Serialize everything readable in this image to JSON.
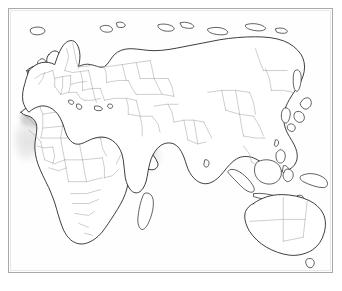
{
  "figure": {
    "hemisphere": "Eastern Hemisphere",
    "projection": "cylindrical",
    "background_color": "#ffffff",
    "frame_color": "#a9a9a9",
    "land_fill": "#ffffff",
    "coastline_color": "#1a1a1a",
    "country_border_color": "#9b9b9b"
  },
  "legend": {
    "visible": false,
    "classes": [
      {
        "name": "core-range",
        "label": "Core range",
        "color": "#9a9a9a",
        "opacity": 0.95
      },
      {
        "name": "main-range",
        "label": "Main range",
        "color": "#b4b4b4",
        "opacity": 0.9
      },
      {
        "name": "peripheral-range",
        "label": "Peripheral range",
        "color": "#cfcfcf",
        "opacity": 0.85
      },
      {
        "name": "marginal-range",
        "label": "Marginal range",
        "color": "#e2e2e2",
        "opacity": 0.8
      }
    ]
  },
  "shaded_regions": [
    {
      "name": "anatolia-levant-mesopotamia-iran",
      "intensity": "core",
      "color": "#9a9a9a"
    },
    {
      "name": "caucasus-caspian",
      "intensity": "core",
      "color": "#9a9a9a"
    },
    {
      "name": "eastern-iran-afghanistan",
      "intensity": "main",
      "color": "#b4b4b4"
    },
    {
      "name": "arabian-peninsula",
      "intensity": "peripheral",
      "color": "#cfcfcf"
    },
    {
      "name": "north-africa-maghreb",
      "intensity": "peripheral",
      "color": "#cfcfcf"
    },
    {
      "name": "sahel-belt",
      "intensity": "marginal",
      "color": "#d8d8d8"
    },
    {
      "name": "nile-valley-egypt",
      "intensity": "peripheral",
      "color": "#cfcfcf"
    },
    {
      "name": "horn-of-africa",
      "intensity": "marginal",
      "color": "#e2e2e2"
    },
    {
      "name": "northwest-india-indus",
      "intensity": "marginal",
      "color": "#dcdcdc"
    },
    {
      "name": "aegean-balkans",
      "intensity": "core",
      "color": "#9a9a9a"
    },
    {
      "name": "west-africa-coast",
      "intensity": "marginal",
      "color": "#e2e2e2"
    }
  ],
  "continents": [
    {
      "name": "africa"
    },
    {
      "name": "europe"
    },
    {
      "name": "asia"
    },
    {
      "name": "australia"
    }
  ],
  "labels": {
    "visible": false,
    "items": []
  }
}
